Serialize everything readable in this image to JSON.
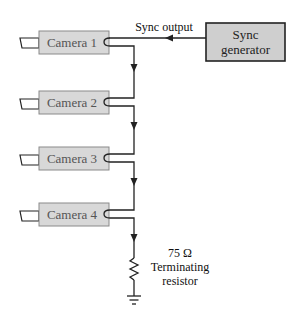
{
  "diagram": {
    "title": "",
    "sync_output_label": "Sync output",
    "generator": {
      "line1": "Sync",
      "line2": "generator"
    },
    "cameras": [
      {
        "label": "Camera 1"
      },
      {
        "label": "Camera 2"
      },
      {
        "label": "Camera 3"
      },
      {
        "label": "Camera 4"
      }
    ],
    "resistor": {
      "value": "75 Ω",
      "line1": "Terminating",
      "line2": "resistor"
    },
    "colors": {
      "camera_fill": "#d8d8d8",
      "camera_border": "#8a8a8a",
      "generator_fill": "#cfcfcf",
      "generator_border": "#222222",
      "wire": "#222222"
    }
  }
}
